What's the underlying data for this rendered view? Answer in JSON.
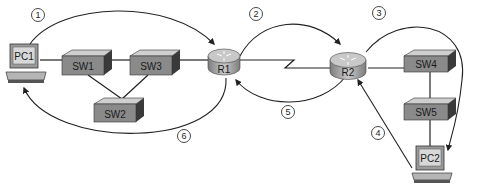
{
  "diagram": {
    "devices": {
      "pc1": "PC1",
      "pc2": "PC2",
      "sw1": "SW1",
      "sw2": "SW2",
      "sw3": "SW3",
      "sw4": "SW4",
      "sw5": "SW5",
      "r1": "R1",
      "r2": "R2"
    },
    "steps": [
      {
        "label": "1",
        "from": "PC1",
        "to": "R1"
      },
      {
        "label": "2",
        "from": "R1",
        "to": "R2"
      },
      {
        "label": "3",
        "from": "R2",
        "to": "PC2"
      },
      {
        "label": "4",
        "from": "PC2",
        "to": "R2"
      },
      {
        "label": "5",
        "from": "R2",
        "to": "R1"
      },
      {
        "label": "6",
        "from": "R1",
        "to": "PC1"
      }
    ],
    "links": [
      [
        "PC1",
        "SW1"
      ],
      [
        "SW1",
        "SW3"
      ],
      [
        "SW1",
        "SW2"
      ],
      [
        "SW3",
        "SW2"
      ],
      [
        "SW3",
        "R1"
      ],
      [
        "R1",
        "R2"
      ],
      [
        "R2",
        "SW4"
      ],
      [
        "SW4",
        "SW5"
      ],
      [
        "SW5",
        "PC2"
      ]
    ],
    "colors": {
      "line": "#222222",
      "switch_face": "#8a8a8a",
      "switch_top": "#cfcfcf",
      "switch_side": "#3a3a3a",
      "router_top": "#c8c8c8",
      "router_side": "#9a9a9a",
      "pc_screen": "#d8d8d8"
    }
  }
}
